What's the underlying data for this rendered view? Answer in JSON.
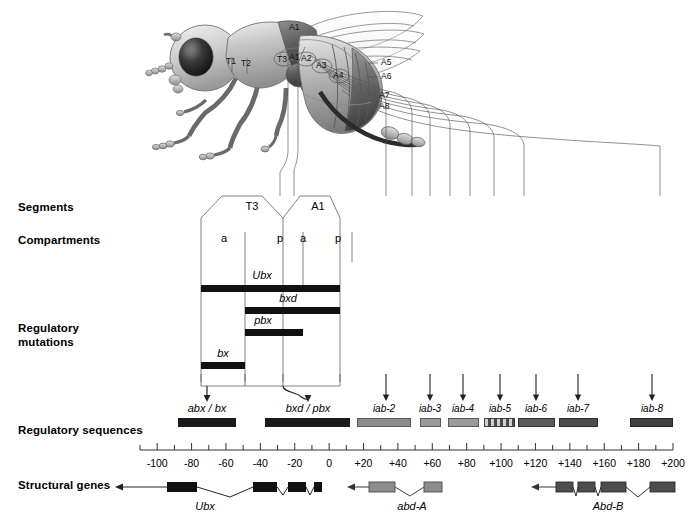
{
  "figure": {
    "row_labels": [
      {
        "id": "segments",
        "text": "Segments"
      },
      {
        "id": "compartments",
        "text": "Compartments"
      },
      {
        "id": "regulatory-mutations",
        "text": "Regulatory\nmutations"
      },
      {
        "id": "regulatory-sequences",
        "text": "Regulatory sequences"
      },
      {
        "id": "structural-genes",
        "text": "Structural genes"
      }
    ]
  },
  "fly": {
    "labels": [
      {
        "name": "T1",
        "text": "T1",
        "x": 232,
        "y": 62
      },
      {
        "name": "T2",
        "text": "T2",
        "x": 247,
        "y": 64
      },
      {
        "name": "T3",
        "text": "T3",
        "x": 282,
        "y": 59
      },
      {
        "name": "A1",
        "text": "A1",
        "x": 294,
        "y": 57
      },
      {
        "name": "A2",
        "text": "A2",
        "x": 308,
        "y": 59
      },
      {
        "name": "A3",
        "text": "A3",
        "x": 323,
        "y": 66
      },
      {
        "name": "A4",
        "text": "A4",
        "x": 340,
        "y": 76
      },
      {
        "name": "A5",
        "text": "A5",
        "x": 384,
        "y": 63
      },
      {
        "name": "A6",
        "text": "A6",
        "x": 384,
        "y": 77
      },
      {
        "name": "A7",
        "text": "A7",
        "x": 382,
        "y": 96
      },
      {
        "name": "A8",
        "text": "A8",
        "x": 382,
        "y": 107
      },
      {
        "name": "A1-wing",
        "text": "A1",
        "x": 295,
        "y": 27
      }
    ]
  },
  "segments": {
    "label_y": 206,
    "items": [
      {
        "name": "segment-t3",
        "text": "T3",
        "x": 252
      },
      {
        "name": "segment-a1",
        "text": "A1",
        "x": 318
      }
    ]
  },
  "compartments": {
    "label_y": 238,
    "items": [
      {
        "name": "compartment-t3-a",
        "text": "a",
        "x": 224
      },
      {
        "name": "compartment-t3-p",
        "text": "p",
        "x": 280
      },
      {
        "name": "compartment-a1-a",
        "text": "a",
        "x": 303
      },
      {
        "name": "compartment-a1-p",
        "text": "p",
        "x": 338
      }
    ]
  },
  "regulatory_mutations": [
    {
      "name": "mutation-ubx",
      "label": "Ubx",
      "label_x": 262,
      "label_y": 269,
      "x": 201,
      "y": 285,
      "w": 139,
      "color": "#111111"
    },
    {
      "name": "mutation-bxd",
      "label": "bxd",
      "label_x": 288,
      "label_y": 292,
      "x": 245,
      "y": 307,
      "w": 95,
      "color": "#111111"
    },
    {
      "name": "mutation-pbx",
      "label": "pbx",
      "label_x": 263,
      "label_y": 314,
      "x": 245,
      "y": 329,
      "w": 58,
      "color": "#111111"
    },
    {
      "name": "mutation-bx",
      "label": "bx",
      "label_x": 223,
      "label_y": 347,
      "x": 201,
      "y": 362,
      "w": 44,
      "color": "#111111"
    }
  ],
  "regulatory_sequences": {
    "label_y": 429,
    "bar_y": 418,
    "items": [
      {
        "name": "regseq-abx-bx",
        "label": "abx / bx",
        "label_x": 207,
        "label_y": 404,
        "x": 178,
        "w": 58,
        "color": "#1a1a1a",
        "striped": false
      },
      {
        "name": "regseq-bxd-pbx",
        "label": "bxd / pbx",
        "label_x": 308,
        "label_y": 404,
        "x": 265,
        "w": 85,
        "color": "#1a1a1a",
        "striped": false
      },
      {
        "name": "regseq-iab-2",
        "label": "iab-2",
        "label_x": 384,
        "label_y": 404,
        "x": 357,
        "w": 54,
        "color": "#8c8c8c",
        "striped": false
      },
      {
        "name": "regseq-iab-3",
        "label": "iab-3",
        "label_x": 430,
        "label_y": 404,
        "x": 420,
        "w": 21,
        "color": "#9a9a9a",
        "striped": false
      },
      {
        "name": "regseq-iab-4",
        "label": "iab-4",
        "label_x": 463,
        "label_y": 404,
        "x": 448,
        "w": 31,
        "color": "#9a9a9a",
        "striped": false
      },
      {
        "name": "regseq-iab-5",
        "label": "iab-5",
        "label_x": 500,
        "label_y": 404,
        "x": 484,
        "w": 31,
        "color": "#6e6e6e",
        "striped": true
      },
      {
        "name": "regseq-iab-6",
        "label": "iab-6",
        "label_x": 536,
        "label_y": 404,
        "x": 518,
        "w": 37,
        "color": "#5a5a5a",
        "striped": false
      },
      {
        "name": "regseq-iab-7",
        "label": "iab-7",
        "label_x": 578,
        "label_y": 404,
        "x": 559,
        "w": 39,
        "color": "#4d4d4d",
        "striped": false
      },
      {
        "name": "regseq-iab-8",
        "label": "iab-8",
        "label_x": 652,
        "label_y": 404,
        "x": 630,
        "w": 43,
        "color": "#404040",
        "striped": false
      }
    ]
  },
  "axis": {
    "y": 450,
    "x_left": 140,
    "x_right": 673,
    "min": -110,
    "max": 200,
    "tick_step": 10,
    "label_step": 20,
    "unit_hint": "kilobases",
    "labels": [
      "-100",
      "-80",
      "-60",
      "-40",
      "-20",
      "0",
      "+20",
      "+40",
      "+60",
      "+80",
      "+100",
      "+120",
      "+140",
      "+160",
      "+180",
      "+200"
    ],
    "label_values": [
      -100,
      -80,
      -60,
      -40,
      -20,
      0,
      20,
      40,
      60,
      80,
      100,
      120,
      140,
      160,
      180,
      200
    ],
    "label_y": 457
  },
  "structural_genes": [
    {
      "name": "gene-ubx",
      "label": "Ubx",
      "label_x": 205,
      "label_y": 503,
      "color": "#111111",
      "arrow_x": 160,
      "exons": [
        {
          "x": 167,
          "w": 30,
          "h": 9
        },
        {
          "x": 253,
          "w": 24,
          "h": 9
        },
        {
          "x": 288,
          "w": 18,
          "h": 9
        },
        {
          "x": 314,
          "w": 8,
          "h": 9
        }
      ]
    },
    {
      "name": "gene-abd-a",
      "label": "abd-A",
      "label_x": 412,
      "label_y": 503,
      "color": "#8c8c8c",
      "arrow_x": 358,
      "exons": [
        {
          "x": 369,
          "w": 26,
          "h": 9
        },
        {
          "x": 424,
          "w": 18,
          "h": 9
        }
      ]
    },
    {
      "name": "gene-abd-b",
      "label": "Abd-B",
      "label_x": 608,
      "label_y": 503,
      "color": "#4d4d4d",
      "arrow_x": 542,
      "exons": [
        {
          "x": 556,
          "w": 17,
          "h": 9
        },
        {
          "x": 578,
          "w": 17,
          "h": 9
        },
        {
          "x": 601,
          "w": 25,
          "h": 9
        },
        {
          "x": 650,
          "w": 25,
          "h": 9
        }
      ]
    }
  ],
  "colors": {
    "line": "#333333",
    "bar_dark": "#111111",
    "bar_mid": "#6e6e6e",
    "bar_light": "#9a9a9a",
    "background": "#ffffff"
  }
}
